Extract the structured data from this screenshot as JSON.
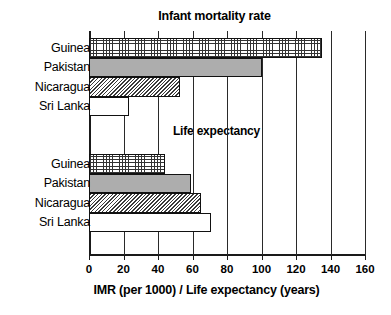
{
  "chart_data": {
    "type": "bar",
    "orientation": "horizontal",
    "title": "Infant mortality rate",
    "group2_title": "Life expectancy",
    "xlabel": "IMR (per 1000) / Life expectancy (years)",
    "ylabel": "",
    "xlim": [
      0,
      160
    ],
    "xticks": [
      0,
      20,
      40,
      60,
      80,
      100,
      120,
      140,
      160
    ],
    "xticklabels": [
      "0",
      "20",
      "40",
      "60",
      "80",
      "100",
      "120",
      "140",
      "160"
    ],
    "grid": true,
    "legend": "none",
    "categories": [
      "Guinea",
      "Pakistan",
      "Nicaragua",
      "Sri Lanka"
    ],
    "groups": [
      {
        "name": "Infant mortality rate",
        "unit": "per 1000",
        "bars": [
          {
            "label": "Guinea",
            "value": 135,
            "pattern": "grid"
          },
          {
            "label": "Pakistan",
            "value": 100,
            "pattern": "solid"
          },
          {
            "label": "Nicaragua",
            "value": 53,
            "pattern": "diag"
          },
          {
            "label": "Sri Lanka",
            "value": 23,
            "pattern": "white"
          }
        ]
      },
      {
        "name": "Life expectancy",
        "unit": "years",
        "bars": [
          {
            "label": "Guinea",
            "value": 44,
            "pattern": "grid"
          },
          {
            "label": "Pakistan",
            "value": 59,
            "pattern": "solid"
          },
          {
            "label": "Nicaragua",
            "value": 65,
            "pattern": "diag"
          },
          {
            "label": "Sri Lanka",
            "value": 71,
            "pattern": "white"
          }
        ]
      }
    ],
    "series": [
      {
        "name": "Infant mortality rate",
        "values": [
          135,
          100,
          53,
          23
        ]
      },
      {
        "name": "Life expectancy",
        "values": [
          44,
          59,
          65,
          71
        ]
      }
    ],
    "colors": {
      "axis": "#1a1a1a",
      "gridline": "#2a2a2a",
      "bar_outline": "#111111",
      "solid_fill": "#adadad",
      "background": "#ffffff"
    }
  }
}
